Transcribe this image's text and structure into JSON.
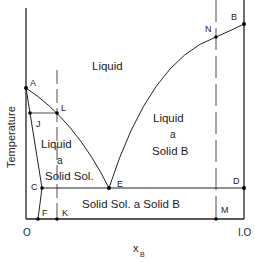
{
  "diagram": {
    "type": "binary eutectic phase diagram",
    "axes": {
      "y_label": "Temperature",
      "x_label": "x",
      "x_label_subscript": "B",
      "x_ticks": [
        "O",
        "I.O"
      ]
    },
    "regions": {
      "liquid": "Liquid",
      "liquid_solid_sol": [
        "Liquid",
        "a",
        "Solid Sol."
      ],
      "liquid_solid_b": [
        "Liquid",
        "a",
        "Solid B"
      ],
      "solid_sol_solid_b": "Solid Sol. a Solid B"
    },
    "points": {
      "A": "A",
      "B": "B",
      "C": "C",
      "D": "D",
      "E": "E",
      "F": "F",
      "J": "J",
      "K": "K",
      "L": "L",
      "M": "M",
      "N": "N"
    },
    "colors": {
      "line": "#222222",
      "background": "#ffffff"
    }
  }
}
